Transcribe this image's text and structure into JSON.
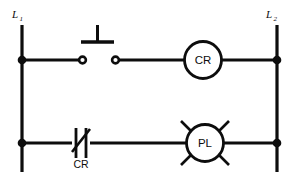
{
  "diagram": {
    "type": "ladder-logic-control-circuit",
    "title": "",
    "rails": {
      "left": {
        "label": "L",
        "subscript": "1",
        "name": "line-1"
      },
      "right": {
        "label": "L",
        "subscript": "2",
        "name": "line-2"
      }
    },
    "rungs": [
      {
        "id": "rung-1",
        "components": [
          {
            "type": "pushbutton-normally-open",
            "name": "start-pushbutton",
            "label": ""
          },
          {
            "type": "relay-coil",
            "name": "control-relay-coil",
            "label": "CR"
          }
        ]
      },
      {
        "id": "rung-2",
        "components": [
          {
            "type": "contact-normally-closed",
            "name": "cr-normally-closed-contact",
            "label": "CR"
          },
          {
            "type": "pilot-light",
            "name": "pilot-light",
            "label": "PL"
          }
        ]
      }
    ],
    "colors": {
      "line": "#0d0d0d",
      "background": "#ffffff",
      "fill": "#ffffff"
    }
  }
}
